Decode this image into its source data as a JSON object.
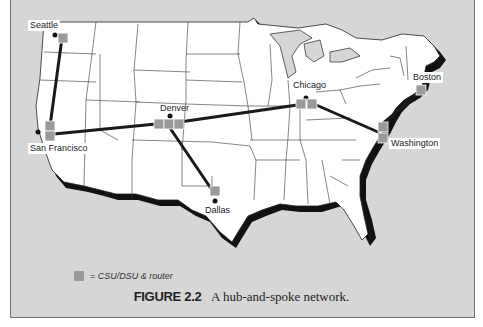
{
  "figure": {
    "number_label": "FIGURE 2.2",
    "caption": "A hub-and-spoke network.",
    "top_text_fragment": "hub-and-spoke ... (cut off)"
  },
  "legend": {
    "symbol": "gray-square",
    "text": "= CSU/DSU & router",
    "color": "#9a9a9a"
  },
  "colors": {
    "panel_background": "#d6d6d6",
    "land": "#ffffff",
    "coast_shadow": "#111111",
    "link": "#1a1a1a",
    "router": "#9a9a9a"
  },
  "nodes": [
    {
      "id": "seattle",
      "label": "Seattle",
      "routers": 1
    },
    {
      "id": "san-francisco",
      "label": "San Francisco",
      "routers": 2
    },
    {
      "id": "denver",
      "label": "Denver",
      "routers": 3,
      "role": "hub"
    },
    {
      "id": "dallas",
      "label": "Dallas",
      "routers": 1
    },
    {
      "id": "chicago",
      "label": "Chicago",
      "routers": 2
    },
    {
      "id": "washington",
      "label": "Washington",
      "routers": 2
    },
    {
      "id": "boston",
      "label": "Boston",
      "routers": 1
    }
  ],
  "links": [
    {
      "from": "Seattle",
      "to": "San Francisco"
    },
    {
      "from": "San Francisco",
      "to": "Denver"
    },
    {
      "from": "Denver",
      "to": "Dallas"
    },
    {
      "from": "Denver",
      "to": "Chicago"
    },
    {
      "from": "Chicago",
      "to": "Washington"
    },
    {
      "from": "Washington",
      "to": "Boston"
    }
  ]
}
